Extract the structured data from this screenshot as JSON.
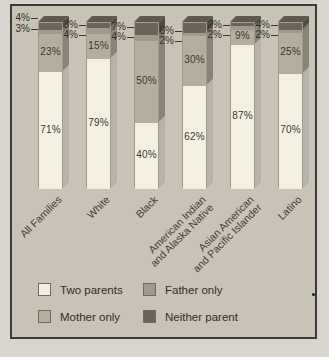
{
  "figure": {
    "outer_background": "#d8d5ce",
    "chart_background": "#c8c3b6",
    "border_color": "#3c3b37",
    "top_face_color": "#5e584e",
    "text_color": "#33312b"
  },
  "chart_data": {
    "type": "bar",
    "stacked": true,
    "variant": "3d-column",
    "unit": "%",
    "title": "",
    "xlabel": "",
    "ylabel": "",
    "ylim": [
      0,
      100
    ],
    "grid": false,
    "legend_position": "bottom",
    "categories": [
      "All Families",
      "White",
      "Black",
      "American Indian\nand Alaska Native",
      "Asian American\nand Pacific Islander",
      "Latino"
    ],
    "series": [
      {
        "name": "Two parents",
        "values": [
          71,
          79,
          40,
          62,
          87,
          70
        ],
        "color": "#f3f0e2"
      },
      {
        "name": "Mother only",
        "values": [
          23,
          15,
          50,
          30,
          9,
          25
        ],
        "color": "#b5ae9e"
      },
      {
        "name": "Father only",
        "values": [
          3,
          4,
          4,
          2,
          2,
          2
        ],
        "color": "#a19a8c"
      },
      {
        "name": "Neither parent",
        "values": [
          4,
          3,
          7,
          6,
          2,
          4
        ],
        "color": "#6b6459"
      }
    ]
  },
  "legend": {
    "items": [
      {
        "label": "Two parents",
        "series_index": 0
      },
      {
        "label": "Father only",
        "series_index": 2
      },
      {
        "label": "Mother only",
        "series_index": 1
      },
      {
        "label": "Neither parent",
        "series_index": 3
      }
    ]
  }
}
